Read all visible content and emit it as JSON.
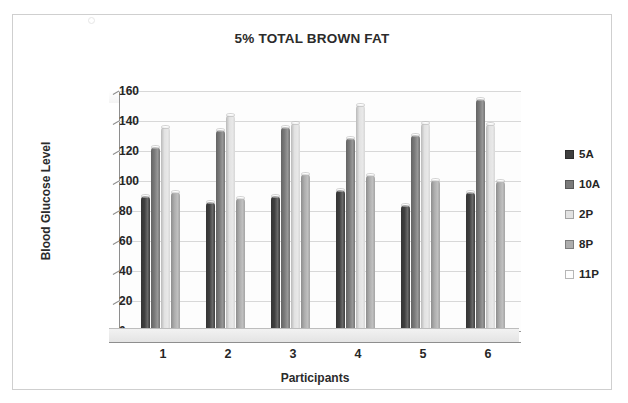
{
  "chart_data": {
    "type": "bar",
    "title": "5% TOTAL BROWN FAT",
    "xlabel": "Participants",
    "ylabel": "Blood Glucose Level",
    "categories": [
      "1",
      "2",
      "3",
      "4",
      "5",
      "6"
    ],
    "ylim": [
      0,
      160
    ],
    "yticks": [
      0,
      20,
      40,
      60,
      80,
      100,
      120,
      140,
      160
    ],
    "grid": true,
    "legend_position": "right",
    "series": [
      {
        "name": "5A",
        "color": "#3f3f3f",
        "values": [
          90,
          86,
          90,
          94,
          84,
          93
        ]
      },
      {
        "name": "10A",
        "color": "#7a7a7a",
        "values": [
          123,
          134,
          136,
          129,
          131,
          155
        ]
      },
      {
        "name": "2P",
        "color": "#e2e2e2",
        "values": [
          136,
          144,
          139,
          151,
          139,
          138
        ]
      },
      {
        "name": "8P",
        "color": "#adadad",
        "values": [
          93,
          89,
          105,
          104,
          101,
          100
        ]
      },
      {
        "name": "11P",
        "color": "#fbfbfb",
        "values": [
          0,
          0,
          0,
          0,
          0,
          0
        ]
      }
    ]
  },
  "legend": {
    "items": [
      {
        "label": "5A",
        "color": "#3f3f3f"
      },
      {
        "label": "10A",
        "color": "#7a7a7a"
      },
      {
        "label": "2P",
        "color": "#e2e2e2"
      },
      {
        "label": "8P",
        "color": "#adadad"
      },
      {
        "label": "11P",
        "color": "#fdfdfd"
      }
    ]
  }
}
